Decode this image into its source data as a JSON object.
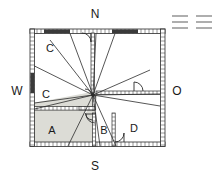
{
  "figure": {
    "kind": "architectural-floor-plan",
    "background_color": "#ffffff",
    "wall_color": "#2b2b2b",
    "hatch_color": "#7a7a7a",
    "shaded_room_fill": "#dcdcd6",
    "opening_color": "#3a3a3a",
    "width": 222,
    "height": 180
  },
  "compass": {
    "north": "N",
    "south": "S",
    "west": "W",
    "east": "O"
  },
  "rooms": [
    {
      "id": "room-c-upper",
      "label": "C",
      "x": 50,
      "y": 48
    },
    {
      "id": "room-c-lower",
      "label": "C",
      "x": 46,
      "y": 94
    },
    {
      "id": "room-a",
      "label": "A",
      "x": 52,
      "y": 134,
      "shaded": true
    },
    {
      "id": "room-b",
      "label": "B",
      "x": 103,
      "y": 134
    },
    {
      "id": "room-d",
      "label": "D",
      "x": 133,
      "y": 132
    }
  ],
  "legend": {
    "name": "hatch-scale-marks",
    "groups": 2,
    "lines_per_group": 3
  }
}
